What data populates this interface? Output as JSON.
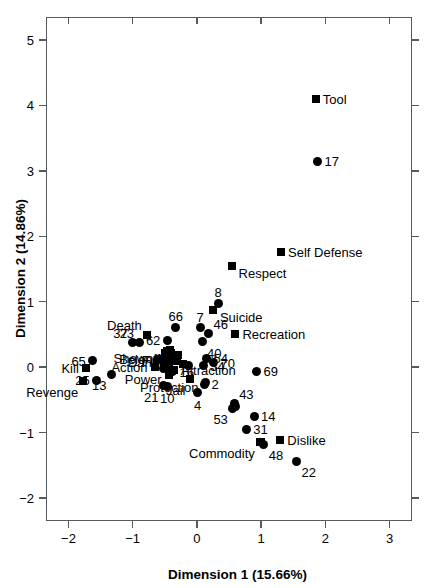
{
  "chart_data": {
    "type": "scatter",
    "title": "",
    "xlabel": "Dimension 1 (15.66%)",
    "ylabel": "Dimension 2 (14.86%)",
    "xlim": [
      -2.35,
      3.35
    ],
    "ylim": [
      -2.35,
      5.35
    ],
    "xticks": [
      -2,
      -1,
      0,
      1,
      2,
      3
    ],
    "xticklabels": [
      "−2",
      "−1",
      "0",
      "1",
      "2",
      "3"
    ],
    "yticks": [
      -2,
      -1,
      0,
      1,
      2,
      3,
      4,
      5
    ],
    "yticklabels": [
      "−2",
      "−1",
      "0",
      "1",
      "2",
      "3",
      "4",
      "5"
    ],
    "grid": false,
    "legend": "none",
    "marker_types": [
      "square",
      "circle"
    ],
    "marker_color": "#000000",
    "series": [
      {
        "name": "attributes",
        "marker": "square",
        "points": [
          {
            "label": "Tool",
            "x": 1.85,
            "y": 4.1,
            "label_pos": "right"
          },
          {
            "label": "Self Defense",
            "x": 1.31,
            "y": 1.76,
            "label_pos": "right"
          },
          {
            "label": "Respect",
            "x": 0.54,
            "y": 1.55,
            "label_pos": "right-below"
          },
          {
            "label": "Suicide",
            "x": 0.25,
            "y": 0.88,
            "label_pos": "right-below"
          },
          {
            "label": "Recreation",
            "x": 0.6,
            "y": 0.5,
            "label_pos": "right"
          },
          {
            "label": "Death",
            "x": -0.78,
            "y": 0.49,
            "label_pos": "above-left"
          },
          {
            "label": "Showoff",
            "x": -0.46,
            "y": 0.24,
            "label_pos": "left-below"
          },
          {
            "label": "Fun",
            "x": -0.4,
            "y": 0.22,
            "label_pos": "left-below"
          },
          {
            "label": "Danger",
            "x": -0.3,
            "y": 0.18,
            "label_pos": "left-below"
          },
          {
            "label": "Belong",
            "x": -0.47,
            "y": 0.12,
            "label_pos": "left"
          },
          {
            "label": "Action",
            "x": -0.66,
            "y": 0.0,
            "label_pos": "left"
          },
          {
            "label": "Kill",
            "x": -1.73,
            "y": -0.02,
            "label_pos": "left"
          },
          {
            "label": "Attraction",
            "x": -0.36,
            "y": -0.05,
            "label_pos": "right"
          },
          {
            "label": "Power",
            "x": -0.44,
            "y": -0.07,
            "label_pos": "left-below"
          },
          {
            "label": "Revenge",
            "x": -1.77,
            "y": -0.21,
            "label_pos": "below-left"
          },
          {
            "label": "Protection",
            "x": -0.43,
            "y": -0.12,
            "label_pos": "below"
          },
          {
            "label": "Jail",
            "x": -0.1,
            "y": -0.18,
            "label_pos": "below-left"
          },
          {
            "label": "Commodity",
            "x": 0.98,
            "y": -1.14,
            "label_pos": "below-left"
          },
          {
            "label": "Dislike",
            "x": 1.3,
            "y": -1.12,
            "label_pos": "right"
          }
        ]
      },
      {
        "name": "drugs",
        "marker": "circle",
        "points": [
          {
            "label": "17",
            "x": 1.88,
            "y": 3.15,
            "label_pos": "right"
          },
          {
            "label": "8",
            "x": 0.33,
            "y": 0.98,
            "label_pos": "above"
          },
          {
            "label": "66",
            "x": -0.33,
            "y": 0.61,
            "label_pos": "above"
          },
          {
            "label": "7",
            "x": 0.05,
            "y": 0.6,
            "label_pos": "above"
          },
          {
            "label": "46",
            "x": 0.18,
            "y": 0.51,
            "label_pos": "above-right"
          },
          {
            "label": "37",
            "x": -1.0,
            "y": 0.37,
            "label_pos": "above-left"
          },
          {
            "label": "23",
            "x": -0.9,
            "y": 0.37,
            "label_pos": "above-left"
          },
          {
            "label": "62",
            "x": -0.46,
            "y": 0.41,
            "label_pos": "left"
          },
          {
            "label": "40",
            "x": 0.08,
            "y": 0.39,
            "label_pos": "below-right"
          },
          {
            "label": "65",
            "x": -1.62,
            "y": 0.1,
            "label_pos": "left"
          },
          {
            "label": "54",
            "x": 0.15,
            "y": 0.14,
            "label_pos": "right"
          },
          {
            "label": "70",
            "x": 0.26,
            "y": 0.07,
            "label_pos": "right"
          },
          {
            "label": "34",
            "x": 0.1,
            "y": 0.02,
            "label_pos": "right"
          },
          {
            "label": "13",
            "x": -1.33,
            "y": -0.11,
            "label_pos": "below-left"
          },
          {
            "label": "16",
            "x": -0.38,
            "y": -0.07,
            "label_pos": "right"
          },
          {
            "label": "2",
            "x": 0.12,
            "y": -0.26,
            "label_pos": "right"
          },
          {
            "label": "69",
            "x": 0.93,
            "y": -0.06,
            "label_pos": "right"
          },
          {
            "label": "25",
            "x": -1.56,
            "y": -0.2,
            "label_pos": "left"
          },
          {
            "label": "21",
            "x": -0.52,
            "y": -0.28,
            "label_pos": "below-left"
          },
          {
            "label": "10",
            "x": -0.46,
            "y": -0.29,
            "label_pos": "below"
          },
          {
            "label": "4",
            "x": 0.01,
            "y": -0.39,
            "label_pos": "below"
          },
          {
            "label": "43",
            "x": 0.58,
            "y": -0.56,
            "label_pos": "above-right"
          },
          {
            "label": "53",
            "x": 0.56,
            "y": -0.63,
            "label_pos": "below-left"
          },
          {
            "label": "14",
            "x": 0.89,
            "y": -0.75,
            "label_pos": "right"
          },
          {
            "label": "31",
            "x": 0.77,
            "y": -0.95,
            "label_pos": "right"
          },
          {
            "label": "48",
            "x": 1.04,
            "y": -1.18,
            "label_pos": "below-right"
          },
          {
            "label": "22",
            "x": 1.55,
            "y": -1.44,
            "label_pos": "below-right"
          }
        ]
      },
      {
        "name": "cluster-unlabeled",
        "marker": "mixed",
        "points": [
          {
            "label": "",
            "x": -0.49,
            "y": 0.22,
            "marker": "square"
          },
          {
            "label": "",
            "x": -0.42,
            "y": 0.26,
            "marker": "square"
          },
          {
            "label": "",
            "x": -0.53,
            "y": 0.13,
            "marker": "square"
          },
          {
            "label": "",
            "x": -0.47,
            "y": 0.13,
            "marker": "circle"
          },
          {
            "label": "",
            "x": -0.44,
            "y": 0.08,
            "marker": "square"
          },
          {
            "label": "",
            "x": -0.5,
            "y": 0.05,
            "marker": "circle"
          },
          {
            "label": "",
            "x": -0.46,
            "y": 0.02,
            "marker": "circle"
          },
          {
            "label": "",
            "x": -0.52,
            "y": -0.02,
            "marker": "circle"
          },
          {
            "label": "",
            "x": -0.4,
            "y": 0.1,
            "marker": "square"
          },
          {
            "label": "",
            "x": -0.35,
            "y": 0.14,
            "marker": "square"
          },
          {
            "label": "",
            "x": -0.31,
            "y": 0.09,
            "marker": "square"
          },
          {
            "label": "",
            "x": -0.42,
            "y": -0.04,
            "marker": "square"
          },
          {
            "label": "",
            "x": -0.61,
            "y": 0.12,
            "marker": "circle"
          },
          {
            "label": "",
            "x": -0.21,
            "y": 0.05,
            "marker": "square"
          },
          {
            "label": "",
            "x": -0.13,
            "y": 0.03,
            "marker": "circle"
          },
          {
            "label": "",
            "x": 0.6,
            "y": -0.6,
            "marker": "circle"
          },
          {
            "label": "",
            "x": 0.13,
            "y": -0.23,
            "marker": "circle"
          },
          {
            "label": "",
            "x": 1.0,
            "y": -1.15,
            "marker": "square"
          }
        ]
      }
    ]
  },
  "axes": {
    "x_title": "Dimension 1 (15.66%)",
    "y_title": "Dimension 2 (14.86%)"
  }
}
